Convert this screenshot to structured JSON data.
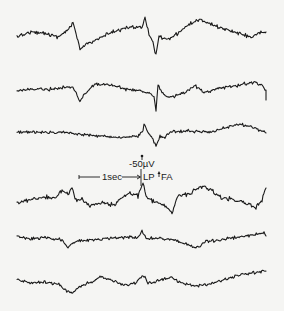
{
  "figure": {
    "type": "eeg-tracing",
    "trace_count": 6,
    "ink_color": "#1a1a1a",
    "background_color": "#f5f5f3"
  },
  "annotations": {
    "amplitude_label": "-50µV",
    "time_label": "1sec",
    "lp_label": "LP",
    "fa_label": "FA"
  },
  "traces": [
    {
      "name": "trace-1",
      "keypoints": [
        [
          17,
          37
        ],
        [
          30,
          32
        ],
        [
          45,
          33
        ],
        [
          58,
          37
        ],
        [
          68,
          30
        ],
        [
          73,
          22
        ],
        [
          77,
          38
        ],
        [
          80,
          50
        ],
        [
          86,
          44
        ],
        [
          100,
          38
        ],
        [
          115,
          31
        ],
        [
          130,
          27
        ],
        [
          142,
          27
        ],
        [
          145,
          17
        ],
        [
          149,
          34
        ],
        [
          153,
          42
        ],
        [
          156,
          56
        ],
        [
          159,
          36
        ],
        [
          163,
          38
        ],
        [
          168,
          40
        ],
        [
          178,
          33
        ],
        [
          188,
          25
        ],
        [
          200,
          19
        ],
        [
          210,
          24
        ],
        [
          225,
          29
        ],
        [
          240,
          34
        ],
        [
          252,
          37
        ],
        [
          260,
          33
        ],
        [
          266,
          32
        ]
      ],
      "noise": 2.2
    },
    {
      "name": "trace-2",
      "keypoints": [
        [
          17,
          91
        ],
        [
          35,
          89
        ],
        [
          55,
          89
        ],
        [
          72,
          86
        ],
        [
          77,
          95
        ],
        [
          80,
          101
        ],
        [
          86,
          93
        ],
        [
          95,
          84
        ],
        [
          110,
          85
        ],
        [
          125,
          89
        ],
        [
          140,
          91
        ],
        [
          150,
          93
        ],
        [
          154,
          96
        ],
        [
          156,
          110
        ],
        [
          158,
          85
        ],
        [
          162,
          92
        ],
        [
          168,
          98
        ],
        [
          185,
          93
        ],
        [
          195,
          86
        ],
        [
          205,
          92
        ],
        [
          220,
          88
        ],
        [
          240,
          85
        ],
        [
          255,
          82
        ],
        [
          262,
          85
        ],
        [
          266,
          90
        ],
        [
          266,
          100
        ]
      ],
      "noise": 2.0
    },
    {
      "name": "trace-3",
      "keypoints": [
        [
          17,
          132
        ],
        [
          35,
          132
        ],
        [
          60,
          132
        ],
        [
          80,
          134
        ],
        [
          100,
          136
        ],
        [
          120,
          138
        ],
        [
          138,
          136
        ],
        [
          143,
          131
        ],
        [
          144,
          124
        ],
        [
          148,
          132
        ],
        [
          153,
          140
        ],
        [
          156,
          146
        ],
        [
          160,
          136
        ],
        [
          165,
          138
        ],
        [
          170,
          132
        ],
        [
          190,
          131
        ],
        [
          210,
          132
        ],
        [
          225,
          128
        ],
        [
          240,
          124
        ],
        [
          255,
          128
        ],
        [
          266,
          133
        ]
      ],
      "noise": 1.8
    },
    {
      "name": "trace-4",
      "keypoints": [
        [
          17,
          203
        ],
        [
          30,
          200
        ],
        [
          45,
          197
        ],
        [
          55,
          199
        ],
        [
          62,
          190
        ],
        [
          68,
          194
        ],
        [
          72,
          188
        ],
        [
          76,
          200
        ],
        [
          82,
          200
        ],
        [
          90,
          205
        ],
        [
          105,
          203
        ],
        [
          115,
          205
        ],
        [
          122,
          197
        ],
        [
          130,
          193
        ],
        [
          138,
          196
        ],
        [
          143,
          183
        ],
        [
          147,
          198
        ],
        [
          155,
          202
        ],
        [
          165,
          206
        ],
        [
          172,
          212
        ],
        [
          178,
          195
        ],
        [
          190,
          194
        ],
        [
          200,
          187
        ],
        [
          205,
          186
        ],
        [
          212,
          190
        ],
        [
          222,
          198
        ],
        [
          235,
          199
        ],
        [
          248,
          205
        ],
        [
          256,
          207
        ],
        [
          262,
          201
        ],
        [
          266,
          188
        ]
      ],
      "noise": 2.6
    },
    {
      "name": "trace-5",
      "keypoints": [
        [
          17,
          236
        ],
        [
          30,
          239
        ],
        [
          45,
          237
        ],
        [
          55,
          239
        ],
        [
          62,
          240
        ],
        [
          68,
          247
        ],
        [
          75,
          241
        ],
        [
          90,
          240
        ],
        [
          110,
          238
        ],
        [
          128,
          237
        ],
        [
          138,
          238
        ],
        [
          142,
          231
        ],
        [
          146,
          239
        ],
        [
          160,
          238
        ],
        [
          175,
          240
        ],
        [
          188,
          245
        ],
        [
          195,
          248
        ],
        [
          205,
          242
        ],
        [
          220,
          240
        ],
        [
          240,
          237
        ],
        [
          258,
          234
        ],
        [
          264,
          232
        ],
        [
          266,
          236
        ]
      ],
      "noise": 2.0
    },
    {
      "name": "trace-6",
      "keypoints": [
        [
          17,
          280
        ],
        [
          30,
          283
        ],
        [
          45,
          282
        ],
        [
          58,
          284
        ],
        [
          65,
          290
        ],
        [
          72,
          293
        ],
        [
          80,
          286
        ],
        [
          92,
          282
        ],
        [
          100,
          277
        ],
        [
          112,
          280
        ],
        [
          122,
          285
        ],
        [
          135,
          283
        ],
        [
          141,
          277
        ],
        [
          145,
          276
        ],
        [
          148,
          284
        ],
        [
          155,
          282
        ],
        [
          163,
          279
        ],
        [
          172,
          278
        ],
        [
          182,
          283
        ],
        [
          195,
          286
        ],
        [
          205,
          285
        ],
        [
          220,
          281
        ],
        [
          235,
          276
        ],
        [
          250,
          273
        ],
        [
          260,
          272
        ],
        [
          266,
          271
        ]
      ],
      "noise": 1.8
    }
  ],
  "calibration": {
    "time_bar": {
      "x1": 79,
      "x2": 100,
      "x3": 122,
      "x4": 141,
      "y": 177
    },
    "amplitude_marker": {
      "x": 142,
      "y_top": 156,
      "y_bottom": 168
    },
    "lp_line": {
      "x": 141,
      "y_top": 170,
      "y_bottom": 185
    },
    "fa_arrow": {
      "x": 159,
      "y_top": 171,
      "y_bottom": 178
    }
  }
}
